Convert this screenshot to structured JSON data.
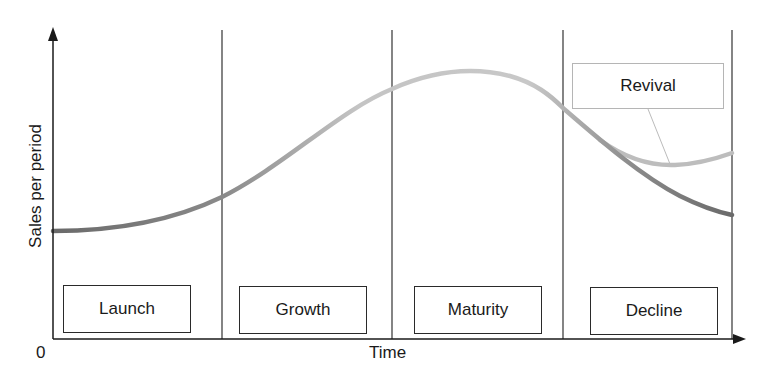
{
  "diagram": {
    "y_axis_label": "Sales per period",
    "x_axis_label": "Time",
    "origin_label": "0",
    "stages": [
      {
        "label": "Launch"
      },
      {
        "label": "Growth"
      },
      {
        "label": "Maturity"
      },
      {
        "label": "Decline"
      }
    ],
    "revival_label": "Revival",
    "colors": {
      "axis": "#1a1a1a",
      "divider": "#333333",
      "curve_dark": "#6e6e6e",
      "curve_light": "#bdbdbd",
      "revival_box_border": "#b5b5b5"
    }
  }
}
